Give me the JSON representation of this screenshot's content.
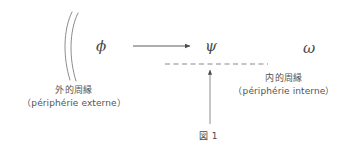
{
  "figure": {
    "caption": "図 1",
    "background_color": "#ffffff",
    "ink_color": "#4a4a4a"
  },
  "symbols": {
    "phi": "ϕ",
    "psi": "ψ",
    "omega": "ω"
  },
  "labels": {
    "outer": {
      "japanese": "外的周縁",
      "french": "（périphérie externe）"
    },
    "inner": {
      "japanese": "内的周縁",
      "french": "（périphérie interne）"
    }
  },
  "diagram_data": {
    "type": "diagram",
    "title": "図 1",
    "nodes": [
      {
        "id": "phi",
        "label": "ϕ",
        "x": 101,
        "y": 46
      },
      {
        "id": "psi",
        "label": "ψ",
        "x": 210,
        "y": 46
      },
      {
        "id": "omega",
        "label": "ω",
        "x": 308,
        "y": 46
      }
    ],
    "edges": [
      {
        "from": "phi",
        "to": "psi",
        "style": "solid-arrow",
        "direction": "right",
        "x1": 133,
        "y1": 46,
        "x2": 192,
        "y2": 46
      },
      {
        "from": "caption-anchor",
        "to": "inner-boundary",
        "style": "solid-arrow",
        "direction": "up",
        "x1": 210,
        "y1": 124,
        "x2": 210,
        "y2": 68
      }
    ],
    "boundaries": [
      {
        "id": "outer-periphery",
        "style": "double-arc",
        "orientation": "vertical",
        "x": 64,
        "y_top": 12,
        "y_bottom": 80,
        "label_ref": "labels.outer"
      },
      {
        "id": "inner-periphery",
        "style": "dashed-line",
        "orientation": "horizontal",
        "x1": 165,
        "x2": 268,
        "y": 64,
        "label_ref": "labels.inner"
      }
    ]
  }
}
